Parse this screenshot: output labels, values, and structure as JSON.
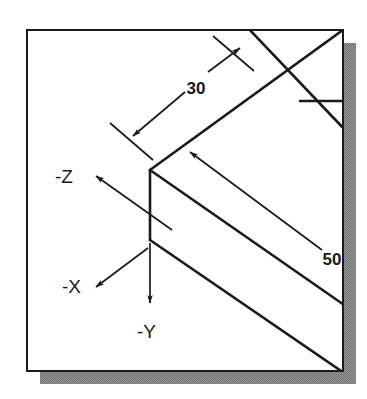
{
  "figure": {
    "background_color": "#ffffff",
    "frame": {
      "name": "drawing-frame",
      "fill": "#ffffff",
      "stroke": "#1a1a1a",
      "x": 27,
      "y": 30,
      "width": 316,
      "height": 341,
      "shadow_color": "#808080",
      "shadow_offset": 13
    },
    "dimensions": [
      {
        "id": "dim-30",
        "label": "30",
        "value": 30,
        "text_x": 196,
        "text_y": 94,
        "line": {
          "x1": 133,
          "y1": 136,
          "x2": 240,
          "y2": 48
        },
        "arrows": "both-ends",
        "extension_lines": [
          {
            "x1": 112,
            "y1": 124,
            "x2": 152,
            "y2": 158
          },
          {
            "x1": 214,
            "y1": 37,
            "x2": 253,
            "y2": 70
          }
        ]
      },
      {
        "id": "dim-50",
        "label": "50",
        "value": 50,
        "text_x": 332,
        "text_y": 265,
        "line": {
          "x1": 190,
          "y1": 152,
          "x2": 330,
          "y2": 257
        },
        "arrows": "single-end-upper-left"
      }
    ],
    "axes": [
      {
        "id": "axis-neg-z",
        "label": "-Z",
        "text_x": 55,
        "text_y": 182,
        "arrow": {
          "x1": 170,
          "y1": 228,
          "x2": 92,
          "y2": 173
        },
        "direction": "up-left"
      },
      {
        "id": "axis-neg-x",
        "label": "-X",
        "text_x": 63,
        "text_y": 291,
        "arrow": {
          "x1": 147,
          "y1": 249,
          "x2": 92,
          "y2": 290
        },
        "direction": "down-left"
      },
      {
        "id": "axis-neg-y",
        "label": "-Y",
        "text_x": 137,
        "text_y": 336,
        "arrow": {
          "x1": 150,
          "y1": 243,
          "x2": 150,
          "y2": 305
        },
        "direction": "down"
      }
    ],
    "solid": {
      "name": "isometric-block",
      "stroke": "#1a1a1a",
      "stroke_width": 2.6,
      "front_vertical_edge": {
        "x1": 150,
        "y1": 170,
        "x2": 150,
        "y2": 240
      },
      "top_left_edge": {
        "x1": 150,
        "y1": 170,
        "x2": 343,
        "y2": 30
      },
      "top_right_edge": {
        "x1": 150,
        "y1": 170,
        "x2": 343,
        "y2": 305
      },
      "bottom_right_edge": {
        "x1": 150,
        "y1": 240,
        "x2": 343,
        "y2": 371
      },
      "back_edge_upper": {
        "x1": 247,
        "y1": 30,
        "x2": 343,
        "y2": 132
      },
      "notch_edge": {
        "x1": 300,
        "y1": 102,
        "x2": 343,
        "y2": 102
      }
    }
  }
}
